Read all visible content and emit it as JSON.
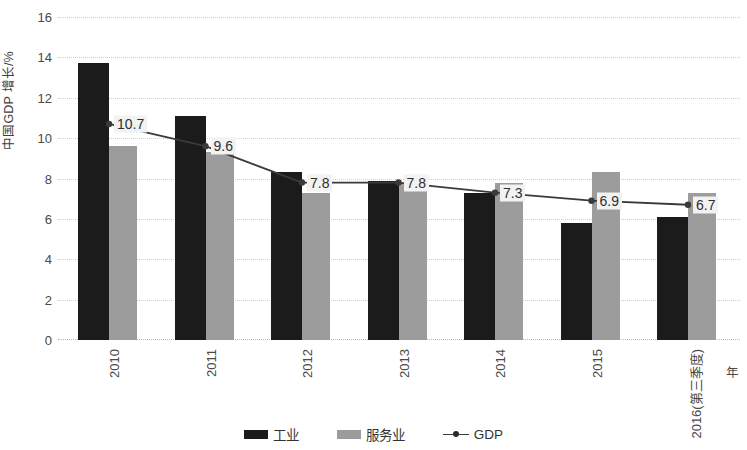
{
  "chart_data": {
    "type": "bar",
    "title": "",
    "xlabel": "年",
    "ylabel": "中国GDP 增长/%",
    "ylim": [
      0,
      16
    ],
    "ytick_step": 2,
    "yticks": [
      "16",
      "14",
      "12",
      "10",
      "8",
      "6",
      "4",
      "2",
      "0"
    ],
    "grid": true,
    "legend_position": "bottom-center",
    "categories": [
      "2010",
      "2011",
      "2012",
      "2013",
      "2014",
      "2015",
      "2016(第三季度)"
    ],
    "series": [
      {
        "name": "工业",
        "type": "bar",
        "color": "#1b1b1b",
        "values": [
          13.7,
          11.1,
          8.3,
          7.9,
          7.3,
          5.8,
          6.1
        ]
      },
      {
        "name": "服务业",
        "type": "bar",
        "color": "#9c9c9c",
        "values": [
          9.6,
          9.3,
          7.3,
          7.8,
          7.8,
          8.3,
          7.3
        ]
      },
      {
        "name": "GDP",
        "type": "line",
        "color": "#3a3a3a",
        "values": [
          10.7,
          9.6,
          7.8,
          7.8,
          7.3,
          6.9,
          6.7
        ],
        "point_labels": [
          "10.7",
          "9.6",
          "7.8",
          "7.8",
          "7.3",
          "6.9",
          "6.7"
        ]
      }
    ]
  },
  "legend": {
    "items": [
      {
        "label": "工业",
        "marker": "bar-swatch-black"
      },
      {
        "label": "服务业",
        "marker": "bar-swatch-gray"
      },
      {
        "label": "GDP",
        "marker": "line-marker"
      }
    ]
  }
}
